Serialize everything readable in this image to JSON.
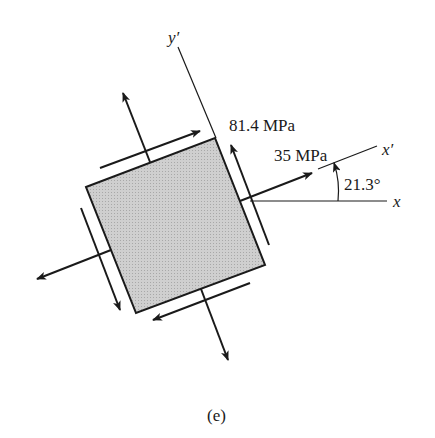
{
  "diagram": {
    "type": "stress-element",
    "rotation_angle_label": "21.3°",
    "normal_stress_label": "81.4 MPa",
    "shear_stress_label": "35 MPa",
    "axis_x_label": "x",
    "axis_xprime_label": "x′",
    "axis_yprime_label": "y′",
    "caption": "(e)",
    "element_fill": "#c8c8c8",
    "stroke_color": "#1a1a1a"
  }
}
